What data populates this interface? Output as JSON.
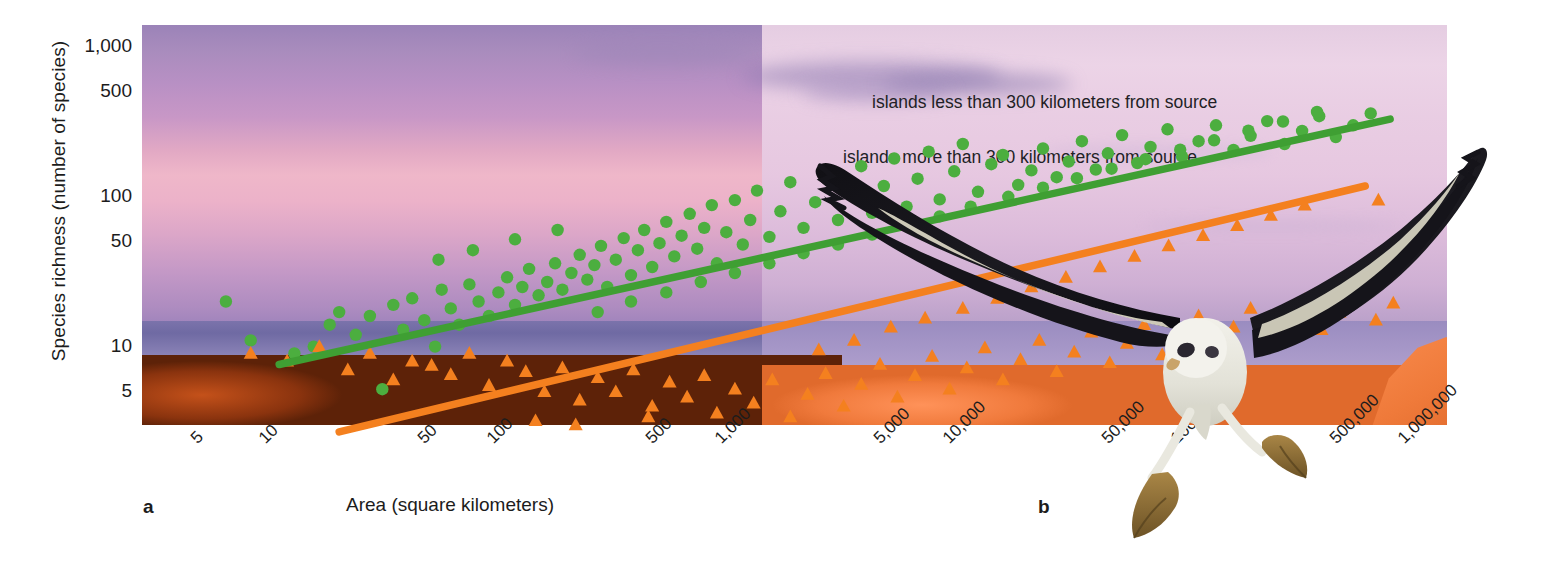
{
  "figure": {
    "panel_a_label": "a",
    "panel_b_label": "b",
    "x_axis_title": "Area (square kilometers)",
    "y_axis_title": "Species richness (number of species)"
  },
  "legend": {
    "entries": [
      {
        "label": "islands less than 300 kilometers from source",
        "color": "#4cae3f",
        "marker": "circle"
      },
      {
        "label": "islands more than 300 kilometers from source",
        "color": "#f4801f",
        "marker": "triangle"
      }
    ]
  },
  "photo": {
    "scene": "sunset-coastline-photograph",
    "subject_b": "albatross-in-flight",
    "sky_top_color": "#9b83b8",
    "sky_band_color": "#efb7c9",
    "ocean_color": "#6f6aa3",
    "rock_color": "#8b3310",
    "rock_right_color": "#f17c3e"
  },
  "chart_data": {
    "type": "scatter",
    "title": "",
    "xlabel": "Area (square kilometers)",
    "ylabel": "Species richness (number of species)",
    "xscale": "log",
    "yscale": "log",
    "xlim": [
      3,
      1600000
    ],
    "ylim": [
      3,
      1400
    ],
    "grid": false,
    "legend_position": "right-inside",
    "xticks": [
      "5",
      "10",
      "50",
      "100",
      "500",
      "1,000",
      "5,000",
      "10,000",
      "50,000",
      "100,000",
      "500,000",
      "1,000,000"
    ],
    "xtick_values": [
      5,
      10,
      50,
      100,
      500,
      1000,
      5000,
      10000,
      50000,
      100000,
      500000,
      1000000
    ],
    "yticks": [
      "1,000",
      "500",
      "100",
      "50",
      "10",
      "5"
    ],
    "ytick_values": [
      1000,
      500,
      100,
      50,
      10,
      5
    ],
    "series": [
      {
        "name": "islands less than 300 kilometers from source",
        "marker": "circle",
        "color": "#4cae3f",
        "trendline": {
          "x": [
            12,
            900000
          ],
          "y": [
            7.6,
            330
          ],
          "color": "#3f9f33"
        },
        "points": [
          [
            7,
            20
          ],
          [
            9,
            11
          ],
          [
            14,
            9
          ],
          [
            17,
            10
          ],
          [
            20,
            14
          ],
          [
            22,
            17
          ],
          [
            26,
            12
          ],
          [
            30,
            16
          ],
          [
            34,
            5.2
          ],
          [
            38,
            19
          ],
          [
            42,
            13
          ],
          [
            46,
            21
          ],
          [
            52,
            15
          ],
          [
            58,
            10
          ],
          [
            62,
            24
          ],
          [
            68,
            18
          ],
          [
            74,
            14
          ],
          [
            82,
            26
          ],
          [
            90,
            20
          ],
          [
            100,
            16
          ],
          [
            110,
            23
          ],
          [
            120,
            29
          ],
          [
            130,
            19
          ],
          [
            140,
            25
          ],
          [
            150,
            33
          ],
          [
            165,
            22
          ],
          [
            180,
            27
          ],
          [
            195,
            36
          ],
          [
            210,
            24
          ],
          [
            230,
            31
          ],
          [
            250,
            41
          ],
          [
            270,
            28
          ],
          [
            290,
            35
          ],
          [
            310,
            47
          ],
          [
            330,
            25
          ],
          [
            360,
            38
          ],
          [
            390,
            53
          ],
          [
            420,
            30
          ],
          [
            450,
            44
          ],
          [
            480,
            60
          ],
          [
            520,
            34
          ],
          [
            560,
            49
          ],
          [
            600,
            68
          ],
          [
            650,
            40
          ],
          [
            700,
            55
          ],
          [
            760,
            77
          ],
          [
            820,
            45
          ],
          [
            880,
            62
          ],
          [
            950,
            88
          ],
          [
            1000,
            36
          ],
          [
            1100,
            58
          ],
          [
            1200,
            95
          ],
          [
            1300,
            48
          ],
          [
            1400,
            70
          ],
          [
            1500,
            110
          ],
          [
            1700,
            54
          ],
          [
            1900,
            80
          ],
          [
            2100,
            125
          ],
          [
            2400,
            62
          ],
          [
            2700,
            92
          ],
          [
            3000,
            140
          ],
          [
            3400,
            70
          ],
          [
            3800,
            105
          ],
          [
            4300,
            160
          ],
          [
            4800,
            78
          ],
          [
            5400,
            118
          ],
          [
            6000,
            180
          ],
          [
            6800,
            86
          ],
          [
            7600,
            132
          ],
          [
            8500,
            200
          ],
          [
            9500,
            96
          ],
          [
            11000,
            148
          ],
          [
            12000,
            225
          ],
          [
            14000,
            108
          ],
          [
            16000,
            165
          ],
          [
            18000,
            190
          ],
          [
            21000,
            120
          ],
          [
            24000,
            150
          ],
          [
            27000,
            210
          ],
          [
            31000,
            135
          ],
          [
            35000,
            172
          ],
          [
            40000,
            235
          ],
          [
            46000,
            152
          ],
          [
            52000,
            195
          ],
          [
            60000,
            258
          ],
          [
            70000,
            168
          ],
          [
            80000,
            215
          ],
          [
            95000,
            282
          ],
          [
            110000,
            185
          ],
          [
            130000,
            235
          ],
          [
            155000,
            300
          ],
          [
            185000,
            205
          ],
          [
            220000,
            255
          ],
          [
            260000,
            320
          ],
          [
            310000,
            225
          ],
          [
            370000,
            275
          ],
          [
            440000,
            345
          ],
          [
            520000,
            250
          ],
          [
            620000,
            300
          ],
          [
            740000,
            360
          ],
          [
            60,
            38
          ],
          [
            85,
            44
          ],
          [
            130,
            52
          ],
          [
            200,
            60
          ],
          [
            300,
            17
          ],
          [
            420,
            20
          ],
          [
            600,
            23
          ],
          [
            850,
            27
          ],
          [
            1200,
            31
          ],
          [
            1700,
            36
          ],
          [
            2400,
            42
          ],
          [
            3400,
            48
          ],
          [
            4800,
            56
          ],
          [
            6800,
            64
          ],
          [
            9500,
            74
          ],
          [
            13000,
            86
          ],
          [
            19000,
            100
          ],
          [
            27000,
            115
          ],
          [
            38000,
            133
          ],
          [
            54000,
            154
          ],
          [
            76000,
            178
          ],
          [
            108000,
            206
          ],
          [
            152000,
            238
          ],
          [
            215000,
            276
          ],
          [
            305000,
            318
          ],
          [
            430000,
            368
          ]
        ]
      },
      {
        "name": "islands more than 300 kilometers from source",
        "marker": "triangle",
        "color": "#f4801f",
        "trendline": {
          "x": [
            22,
            700000
          ],
          "y": [
            2.7,
            118
          ],
          "color": "#f4801f"
        },
        "points": [
          [
            9,
            9
          ],
          [
            13,
            8
          ],
          [
            18,
            10
          ],
          [
            24,
            7
          ],
          [
            30,
            9
          ],
          [
            38,
            6
          ],
          [
            46,
            8
          ],
          [
            56,
            7.5
          ],
          [
            68,
            6.5
          ],
          [
            82,
            9
          ],
          [
            100,
            5.5
          ],
          [
            120,
            8
          ],
          [
            145,
            6.8
          ],
          [
            175,
            5.0
          ],
          [
            210,
            7.2
          ],
          [
            250,
            4.4
          ],
          [
            300,
            6.2
          ],
          [
            360,
            5.0
          ],
          [
            430,
            7.0
          ],
          [
            520,
            4.0
          ],
          [
            620,
            5.8
          ],
          [
            740,
            4.6
          ],
          [
            880,
            6.4
          ],
          [
            1000,
            3.6
          ],
          [
            1200,
            5.2
          ],
          [
            1450,
            4.2
          ],
          [
            1750,
            6.0
          ],
          [
            2100,
            3.4
          ],
          [
            2500,
            4.8
          ],
          [
            3000,
            6.6
          ],
          [
            3600,
            4.0
          ],
          [
            4300,
            5.6
          ],
          [
            5200,
            7.6
          ],
          [
            6200,
            4.6
          ],
          [
            7400,
            6.4
          ],
          [
            8800,
            8.6
          ],
          [
            10500,
            5.2
          ],
          [
            12500,
            7.2
          ],
          [
            15000,
            9.8
          ],
          [
            18000,
            6.0
          ],
          [
            21500,
            8.2
          ],
          [
            26000,
            11.0
          ],
          [
            31000,
            6.8
          ],
          [
            37000,
            9.2
          ],
          [
            44000,
            12.5
          ],
          [
            53000,
            7.8
          ],
          [
            63000,
            10.5
          ],
          [
            75000,
            14.0
          ],
          [
            90000,
            8.8
          ],
          [
            108000,
            11.8
          ],
          [
            130000,
            16.0
          ],
          [
            155000,
            10.0
          ],
          [
            185000,
            13.5
          ],
          [
            220000,
            18.0
          ],
          [
            265000,
            11.5
          ],
          [
            315000,
            15.2
          ],
          [
            380000,
            20.5
          ],
          [
            450000,
            13.0
          ],
          [
            540000,
            17.0
          ],
          [
            650000,
            23.0
          ],
          [
            780000,
            15.0
          ],
          [
            930000,
            19.5
          ],
          [
            800000,
            95
          ],
          [
            160,
            3.2
          ],
          [
            240,
            3.0
          ],
          [
            350,
            2.8
          ],
          [
            500,
            3.4
          ],
          [
            700,
            2.6
          ],
          [
            2800,
            9.5
          ],
          [
            4000,
            11.0
          ],
          [
            5800,
            13.5
          ],
          [
            8200,
            15.5
          ],
          [
            12000,
            18.0
          ],
          [
            17000,
            21.0
          ],
          [
            24000,
            25.0
          ],
          [
            34000,
            29.0
          ],
          [
            48000,
            34.0
          ],
          [
            68000,
            40.0
          ],
          [
            96000,
            47.0
          ],
          [
            136000,
            55.0
          ],
          [
            192000,
            64.0
          ],
          [
            270000,
            75.0
          ],
          [
            380000,
            88.0
          ]
        ]
      }
    ]
  }
}
